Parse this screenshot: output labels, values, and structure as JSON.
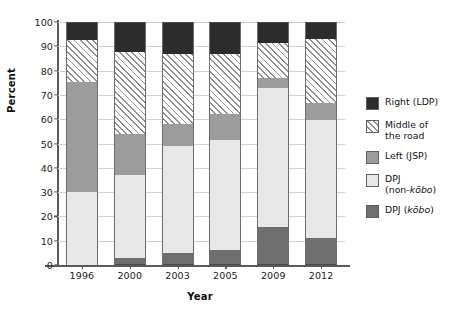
{
  "chart_data": {
    "type": "bar",
    "subtype": "stacked-100-percent",
    "title": "",
    "xlabel": "Year",
    "ylabel": "Percent",
    "ylim": [
      0,
      100
    ],
    "ytick_step": 10,
    "yticks": [
      0,
      10,
      20,
      30,
      40,
      50,
      60,
      70,
      80,
      90,
      100
    ],
    "grid": true,
    "legend_position": "right",
    "categories": [
      "1996",
      "2000",
      "2003",
      "2005",
      "2009",
      "2012"
    ],
    "stack_order_bottom_to_top": [
      "DPJ (kobo)",
      "DPJ (non-kobo)",
      "Left (JSP)",
      "Middle of the road",
      "Right (LDP)"
    ],
    "series": [
      {
        "name": "DPJ (kobo)",
        "values": [
          0.0,
          3.0,
          5.0,
          6.0,
          15.5,
          11.0
        ]
      },
      {
        "name": "DPJ (non-kobo)",
        "values": [
          30.0,
          34.0,
          44.0,
          45.5,
          57.5,
          48.5
        ]
      },
      {
        "name": "Left (JSP)",
        "values": [
          45.5,
          17.0,
          9.0,
          10.5,
          4.0,
          7.0
        ]
      },
      {
        "name": "Middle of the road",
        "values": [
          17.0,
          33.5,
          29.0,
          25.0,
          14.5,
          26.5
        ]
      },
      {
        "name": "Right (LDP)",
        "values": [
          7.5,
          12.5,
          13.0,
          13.0,
          8.5,
          7.0
        ]
      }
    ],
    "cumulative_tops": {
      "1996": [
        0.0,
        30.0,
        75.5,
        92.5,
        100.0
      ],
      "2000": [
        3.0,
        37.0,
        54.0,
        87.5,
        100.0
      ],
      "2003": [
        5.0,
        49.0,
        58.0,
        87.0,
        100.0
      ],
      "2005": [
        6.0,
        51.5,
        62.0,
        87.0,
        100.0
      ],
      "2009": [
        15.5,
        73.0,
        77.0,
        91.5,
        100.0
      ],
      "2012": [
        11.0,
        59.5,
        66.5,
        93.0,
        100.0
      ]
    },
    "colors": {
      "right_ldp": "#2c2c2c",
      "middle_of_the_road": "#fdfdfd",
      "left_jsp": "#9c9c9c",
      "dpj_non_kobo": "#e8e8e8",
      "dpj_kobo": "#6e6e6e",
      "gridline": "#d2d2d2",
      "axis": "#5a5a5a"
    }
  },
  "axes": {
    "y": {
      "label": "Percent",
      "ticks": [
        "0",
        "10",
        "20",
        "30",
        "40",
        "50",
        "60",
        "70",
        "80",
        "90",
        "100"
      ]
    },
    "x": {
      "label": "Year",
      "ticks": [
        "1996",
        "2000",
        "2003",
        "2005",
        "2009",
        "2012"
      ]
    }
  },
  "legend": {
    "items": [
      {
        "key": "right_ldp",
        "label": "Right (LDP)",
        "line2": "",
        "swatch": "solid-dark-swatch"
      },
      {
        "key": "middle",
        "label": "Middle of",
        "line2": "the road",
        "swatch": "hatched-swatch"
      },
      {
        "key": "left_jsp",
        "label": "Left (JSP)",
        "line2": "",
        "swatch": "solid-gray-swatch"
      },
      {
        "key": "dpj_nonkobo",
        "label": "DPJ",
        "line2": "(non-kōbo)",
        "swatch": "solid-light-swatch"
      },
      {
        "key": "dpj_kobo",
        "label": "DPJ (kōbo)",
        "line2": "",
        "swatch": "solid-darkgray-swatch"
      }
    ]
  }
}
